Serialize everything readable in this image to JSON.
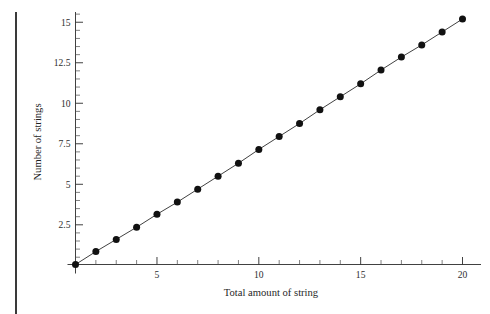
{
  "figure": {
    "background": "#ffffff",
    "margin_rule_color": "#3a3a3a",
    "axis_color": "#2b2b2b",
    "point_color": "#111111"
  },
  "chart_data": {
    "type": "scatter",
    "title": "",
    "xlabel": "Total amount of string",
    "ylabel": "Number of strings",
    "xlim": [
      0.3,
      20.9
    ],
    "ylim": [
      -0.45,
      15.9
    ],
    "grid": false,
    "legend": null,
    "x_ticks_major": [
      5,
      10,
      15,
      20
    ],
    "x_tick_labels": [
      "5",
      "10",
      "15",
      "20"
    ],
    "x_ticks_minor": [
      1,
      2,
      3,
      4,
      6,
      7,
      8,
      9,
      11,
      12,
      13,
      14,
      16,
      17,
      18,
      19
    ],
    "y_ticks_major": [
      2.5,
      5,
      7.5,
      10,
      12.5,
      15
    ],
    "y_tick_labels": [
      "2.5",
      "5",
      "7.5",
      "10",
      "12.5",
      "15"
    ],
    "y_ticks_minor": [
      0.5,
      1,
      1.5,
      2,
      3,
      3.5,
      4,
      4.5,
      5.5,
      6,
      6.5,
      7,
      8,
      8.5,
      9,
      9.5,
      10.5,
      11,
      11.5,
      12,
      13,
      13.5,
      14,
      14.5,
      15.5
    ],
    "x": [
      1,
      2,
      3,
      4,
      5,
      6,
      7,
      8,
      9,
      10,
      11,
      12,
      13,
      14,
      15,
      16,
      17,
      18,
      19,
      20
    ],
    "values": [
      0.05,
      0.85,
      1.6,
      2.35,
      3.15,
      3.9,
      4.7,
      5.5,
      6.3,
      7.15,
      7.95,
      8.75,
      9.6,
      10.4,
      11.2,
      12.05,
      12.85,
      13.6,
      14.4,
      15.2
    ],
    "series": [
      {
        "name": "strings",
        "values": [
          0.05,
          0.85,
          1.6,
          2.35,
          3.15,
          3.9,
          4.7,
          5.5,
          6.3,
          7.15,
          7.95,
          8.75,
          9.6,
          10.4,
          11.2,
          12.05,
          12.85,
          13.6,
          14.4,
          15.2
        ]
      }
    ]
  }
}
